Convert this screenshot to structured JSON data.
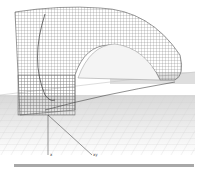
{
  "diagram": {
    "type": "3d-wireframe-shell",
    "colors": {
      "background": "#ffffff",
      "mesh": "#707070",
      "ground_grid": "#cfcfcf",
      "ground_fill": "#e6e6e6",
      "axis": "#333333",
      "bottom_bar": "#a8a8a8"
    },
    "axis_labels": {
      "a": "x",
      "b": "xy"
    }
  }
}
